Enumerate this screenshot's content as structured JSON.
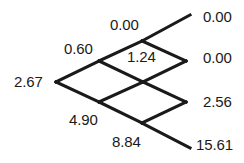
{
  "figure": {
    "type": "binomial-lattice",
    "background_color": "#ffffff",
    "line_color": "#1a1a1a",
    "text_color": "#1a1a1a"
  },
  "chart_data": {
    "type": "diagram",
    "title": "",
    "xlabel": "",
    "ylabel": "",
    "layout": "recombining binomial lattice, 3 steps, values at each node",
    "steps": 3,
    "nodes": [
      {
        "id": "n0_0",
        "step": 0,
        "level": 0,
        "value": "2.67",
        "x": 56,
        "y": 82
      },
      {
        "id": "n1_0",
        "step": 1,
        "level": 0,
        "value": "0.60",
        "x": 99,
        "y": 61
      },
      {
        "id": "n1_1",
        "step": 1,
        "level": 1,
        "value": "4.90",
        "x": 99,
        "y": 102
      },
      {
        "id": "n2_0",
        "step": 2,
        "level": 0,
        "value": "0.00",
        "x": 142,
        "y": 41
      },
      {
        "id": "n2_1",
        "step": 2,
        "level": 1,
        "value": "1.24",
        "x": 143,
        "y": 82
      },
      {
        "id": "n2_2",
        "step": 2,
        "level": 2,
        "value": "8.84",
        "x": 142,
        "y": 123
      },
      {
        "id": "n3_0",
        "step": 3,
        "level": 0,
        "value": "0.00",
        "x": 190,
        "y": 15
      },
      {
        "id": "n3_1",
        "step": 3,
        "level": 1,
        "value": "0.00",
        "x": 186,
        "y": 61
      },
      {
        "id": "n3_2",
        "step": 3,
        "level": 2,
        "value": "2.56",
        "x": 186,
        "y": 102
      },
      {
        "id": "n3_3",
        "step": 3,
        "level": 3,
        "value": "15.61",
        "x": 190,
        "y": 148
      }
    ],
    "edges": [
      {
        "from": "n0_0",
        "to": "n1_0"
      },
      {
        "from": "n0_0",
        "to": "n1_1"
      },
      {
        "from": "n1_0",
        "to": "n2_0"
      },
      {
        "from": "n1_0",
        "to": "n2_1"
      },
      {
        "from": "n1_1",
        "to": "n2_1"
      },
      {
        "from": "n1_1",
        "to": "n2_2"
      },
      {
        "from": "n2_0",
        "to": "n3_0"
      },
      {
        "from": "n2_0",
        "to": "n3_1"
      },
      {
        "from": "n2_1",
        "to": "n3_1"
      },
      {
        "from": "n2_1",
        "to": "n3_2"
      },
      {
        "from": "n2_2",
        "to": "n3_2"
      },
      {
        "from": "n2_2",
        "to": "n3_3"
      }
    ]
  },
  "labels": {
    "root": "2.67",
    "up1": "0.60",
    "down1": "4.90",
    "uu2": "0.00",
    "ud2": "1.24",
    "dd2": "8.84",
    "uuu3": "0.00",
    "uud3": "0.00",
    "udd3": "2.56",
    "ddd3": "15.61"
  },
  "label_positions": {
    "root": {
      "left": 14,
      "top": 74
    },
    "up1": {
      "left": 64,
      "top": 41
    },
    "down1": {
      "left": 69,
      "top": 112
    },
    "uu2": {
      "left": 110,
      "top": 17
    },
    "ud2": {
      "left": 127,
      "top": 49
    },
    "dd2": {
      "left": 112,
      "top": 134
    },
    "uuu3": {
      "left": 203,
      "top": 9
    },
    "uud3": {
      "left": 203,
      "top": 50
    },
    "udd3": {
      "left": 203,
      "top": 94
    },
    "ddd3": {
      "left": 196,
      "top": 137
    }
  }
}
